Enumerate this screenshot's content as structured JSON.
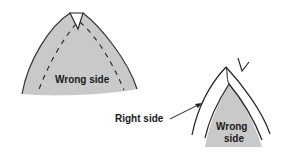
{
  "figure": {
    "left_panel": {
      "label": "Wrong side",
      "fill_color": "#c8c8c8"
    },
    "right_panel": {
      "pointer_label": "Right side",
      "inner_label_line1": "Wrong",
      "inner_label_line2": "side",
      "fill_color": "#c8c8c8"
    },
    "colors": {
      "line": "#222222",
      "background": "#ffffff"
    }
  }
}
